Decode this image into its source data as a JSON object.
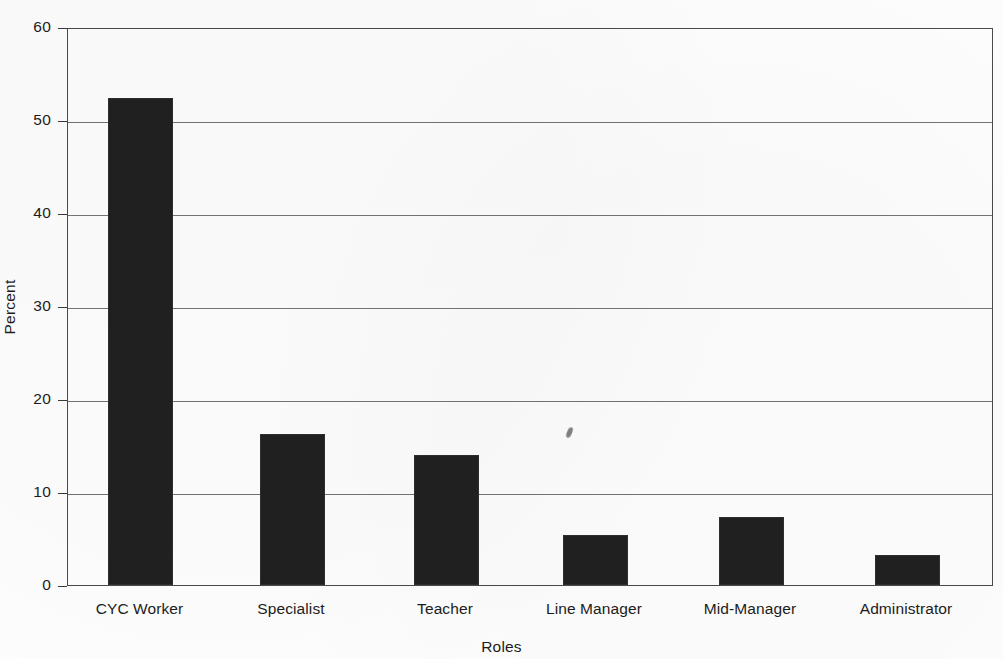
{
  "chart_data": {
    "type": "bar",
    "title": "",
    "subtitle": "",
    "xlabel": "Roles",
    "ylabel": "Percent",
    "categories": [
      "CYC Worker",
      "Specialist",
      "Teacher",
      "Line Manager",
      "Mid-Manager",
      "Administrator"
    ],
    "values": [
      52.4,
      16.2,
      14.0,
      5.4,
      7.3,
      3.2
    ],
    "ylim": [
      0,
      60
    ],
    "yticks": [
      0,
      10,
      20,
      30,
      40,
      50,
      60
    ],
    "ytick_labels": [
      "0",
      "10",
      "20",
      "30",
      "40",
      "50",
      "60"
    ],
    "grid": "horizontal",
    "legend": "none",
    "bar_color": "#202020",
    "gridline_color": "#737373",
    "axis_color": "#3a3a3a",
    "background_color": "#fdfdfd",
    "annotations": []
  },
  "axes": {
    "y_title": "Percent",
    "x_title": "Roles"
  },
  "ticks": {
    "y": [
      {
        "label": "60",
        "value": 60
      },
      {
        "label": "50",
        "value": 50
      },
      {
        "label": "40",
        "value": 40
      },
      {
        "label": "30",
        "value": 30
      },
      {
        "label": "20",
        "value": 20
      },
      {
        "label": "10",
        "value": 10
      },
      {
        "label": "0",
        "value": 0
      }
    ]
  },
  "bars": [
    {
      "label": "CYC Worker",
      "value": 52.4
    },
    {
      "label": "Specialist",
      "value": 16.2
    },
    {
      "label": "Teacher",
      "value": 14.0
    },
    {
      "label": "Line Manager",
      "value": 5.4
    },
    {
      "label": "Mid-Manager",
      "value": 7.3
    },
    {
      "label": "Administrator",
      "value": 3.2
    }
  ]
}
